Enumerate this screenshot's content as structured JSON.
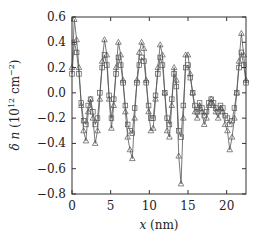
{
  "chart_data": {
    "type": "line",
    "title": "",
    "xlabel": "x (nm)",
    "ylabel": "δ n (10^12 cm^-2)",
    "xlim": [
      0,
      22.5
    ],
    "ylim": [
      -0.8,
      0.6
    ],
    "xticks": [
      0,
      5,
      10,
      15,
      20
    ],
    "xtick_labels": [
      "0",
      "5",
      "10",
      "15",
      "20"
    ],
    "yticks": [
      0.6,
      0.4,
      0.2,
      0.0,
      -0.2,
      -0.4,
      -0.6,
      -0.8
    ],
    "ytick_labels": [
      "0.6",
      "0.4",
      "0.2",
      "0.0",
      "−0.2",
      "−0.4",
      "−0.6",
      "−0.8"
    ],
    "grid": false,
    "legend": null,
    "series": [
      {
        "name": "triangles",
        "marker": "triangle",
        "color": "#555555",
        "x": [
          0.0,
          0.3,
          0.6,
          0.9,
          1.2,
          1.5,
          1.8,
          2.1,
          2.4,
          2.7,
          3.0,
          3.3,
          3.6,
          3.9,
          4.2,
          4.5,
          4.8,
          5.1,
          5.4,
          5.7,
          6.0,
          6.3,
          6.6,
          6.9,
          7.2,
          7.5,
          7.8,
          8.1,
          8.4,
          8.7,
          9.0,
          9.3,
          9.6,
          9.9,
          10.2,
          10.5,
          10.8,
          11.1,
          11.4,
          11.7,
          12.0,
          12.3,
          12.6,
          12.9,
          13.2,
          13.5,
          13.8,
          14.1,
          14.4,
          14.7,
          15.0,
          15.3,
          15.6,
          15.9,
          16.2,
          16.5,
          16.8,
          17.1,
          17.4,
          17.7,
          18.0,
          18.3,
          18.6,
          18.9,
          19.2,
          19.5,
          19.8,
          20.1,
          20.4,
          20.7,
          21.0,
          21.3,
          21.6,
          21.9,
          22.2,
          22.5
        ],
        "y": [
          0.2,
          0.58,
          0.42,
          0.2,
          -0.1,
          -0.3,
          -0.38,
          -0.15,
          -0.05,
          -0.2,
          -0.4,
          -0.3,
          -0.05,
          0.25,
          0.42,
          0.3,
          -0.05,
          -0.28,
          -0.1,
          0.2,
          0.4,
          0.3,
          0.1,
          -0.15,
          -0.35,
          -0.45,
          -0.52,
          -0.2,
          0.1,
          0.32,
          0.4,
          0.35,
          0.1,
          -0.15,
          -0.3,
          -0.28,
          -0.05,
          0.2,
          0.38,
          0.3,
          0.0,
          -0.3,
          -0.35,
          -0.1,
          0.2,
          0.1,
          -0.5,
          -0.72,
          -0.2,
          0.3,
          0.3,
          0.15,
          0.0,
          -0.15,
          -0.2,
          -0.1,
          -0.15,
          -0.25,
          -0.2,
          -0.1,
          -0.05,
          -0.1,
          -0.15,
          -0.2,
          -0.12,
          -0.15,
          -0.25,
          -0.3,
          -0.45,
          -0.35,
          -0.2,
          0.0,
          0.25,
          0.47,
          0.3,
          0.1
        ]
      },
      {
        "name": "squares",
        "marker": "square",
        "color": "#555555",
        "x": [
          0.0,
          0.3,
          0.6,
          0.9,
          1.2,
          1.5,
          1.8,
          2.1,
          2.4,
          2.7,
          3.0,
          3.3,
          3.6,
          3.9,
          4.2,
          4.5,
          4.8,
          5.1,
          5.4,
          5.7,
          6.0,
          6.3,
          6.6,
          6.9,
          7.2,
          7.5,
          7.8,
          8.1,
          8.4,
          8.7,
          9.0,
          9.3,
          9.6,
          9.9,
          10.2,
          10.5,
          10.8,
          11.1,
          11.4,
          11.7,
          12.0,
          12.3,
          12.6,
          12.9,
          13.2,
          13.5,
          13.8,
          14.1,
          14.4,
          14.7,
          15.0,
          15.3,
          15.6,
          15.9,
          16.2,
          16.5,
          16.8,
          17.1,
          17.4,
          17.7,
          18.0,
          18.3,
          18.6,
          18.9,
          19.2,
          19.5,
          19.8,
          20.1,
          20.4,
          20.7,
          21.0,
          21.3,
          21.6,
          21.9,
          22.2,
          22.5
        ],
        "y": [
          0.15,
          0.4,
          0.32,
          0.15,
          -0.08,
          -0.22,
          -0.25,
          -0.1,
          -0.05,
          -0.15,
          -0.25,
          -0.2,
          0.0,
          0.2,
          0.3,
          0.22,
          -0.02,
          -0.2,
          -0.05,
          0.15,
          0.28,
          0.22,
          0.08,
          -0.1,
          -0.25,
          -0.3,
          -0.32,
          -0.12,
          0.08,
          0.22,
          0.28,
          0.25,
          0.08,
          -0.1,
          -0.2,
          -0.2,
          -0.02,
          0.15,
          0.28,
          0.22,
          0.0,
          -0.2,
          -0.25,
          -0.05,
          0.15,
          0.05,
          -0.3,
          -0.35,
          -0.1,
          0.2,
          0.22,
          0.12,
          0.0,
          -0.1,
          -0.15,
          -0.08,
          -0.12,
          -0.18,
          -0.15,
          -0.08,
          -0.05,
          -0.08,
          -0.12,
          -0.15,
          -0.1,
          -0.12,
          -0.18,
          -0.2,
          -0.25,
          -0.22,
          -0.12,
          0.0,
          0.2,
          0.32,
          0.22,
          0.08
        ]
      }
    ]
  }
}
